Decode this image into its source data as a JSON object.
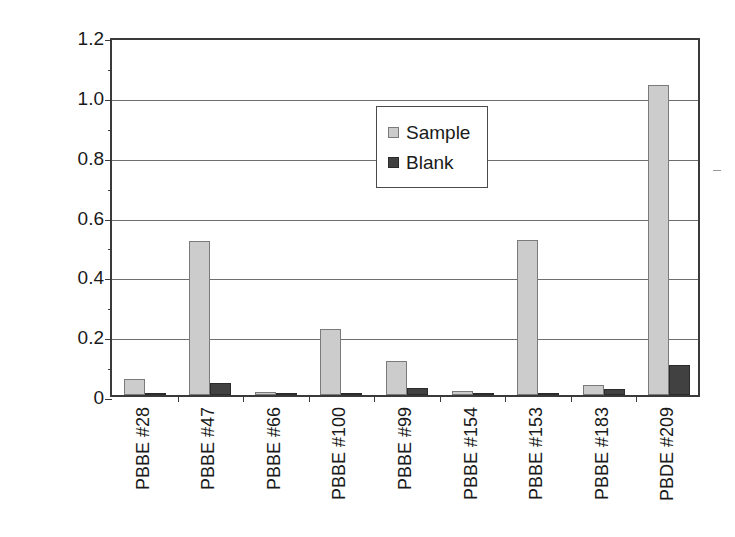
{
  "chart_data": {
    "type": "bar",
    "title": "",
    "xlabel": "",
    "ylabel": "ng/g, lipid based",
    "ylim": [
      0,
      1.2
    ],
    "ytick_labels": [
      "0",
      "0.2",
      "0.4",
      "0.6",
      "0.8",
      "1.0",
      "1.2"
    ],
    "ytick_values": [
      0,
      0.2,
      0.4,
      0.6,
      0.8,
      1.0,
      1.2
    ],
    "grid": true,
    "legend_position": "upper-center",
    "categories": [
      "PBBE #28",
      "PBBE #47",
      "PBBE #66",
      "PBBE #100",
      "PBBE #99",
      "PBBE #154",
      "PBBE #153",
      "PBBE #183",
      "PBDE #209"
    ],
    "series": [
      {
        "name": "Sample",
        "color": "#cccccc",
        "values": [
          0.055,
          0.515,
          0.01,
          0.22,
          0.113,
          0.015,
          0.518,
          0.035,
          1.035
        ]
      },
      {
        "name": "Blank",
        "color": "#414141",
        "values": [
          0.005,
          0.04,
          0.003,
          0.005,
          0.025,
          0.004,
          0.005,
          0.02,
          0.1
        ]
      }
    ]
  },
  "legend": {
    "items": [
      {
        "label": "Sample"
      },
      {
        "label": "Blank"
      }
    ]
  },
  "colors": {
    "sample": "#cccccc",
    "blank": "#414141",
    "axis": "#3a3a3a",
    "grid": "#6e6e6e",
    "background": "#ffffff"
  }
}
